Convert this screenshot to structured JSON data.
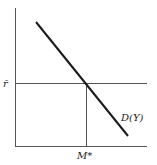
{
  "diagram": {
    "labels": {
      "y_level": "r̄",
      "x_level": "M*",
      "curve": "D(Y)"
    },
    "colors": {
      "axis": "#555555",
      "guide": "#555555",
      "curve": "#1a1a1a",
      "background": "#ffffff"
    }
  }
}
